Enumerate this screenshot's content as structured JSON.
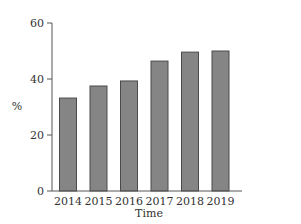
{
  "chart_data": {
    "type": "bar",
    "title": "",
    "xlabel": "Time",
    "ylabel": "%",
    "categories": [
      "2014",
      "2015",
      "2016",
      "2017",
      "2018",
      "2019"
    ],
    "values": [
      33.2,
      37.5,
      39.3,
      46.4,
      49.6,
      50.0
    ],
    "ylim": [
      0,
      60
    ],
    "yticks": [
      "0",
      "20",
      "40",
      "60"
    ],
    "grid": false,
    "legend": null,
    "bar_color": "#858585",
    "bar_edge_color": "#4a4a4a",
    "axis_color": "#555555"
  }
}
